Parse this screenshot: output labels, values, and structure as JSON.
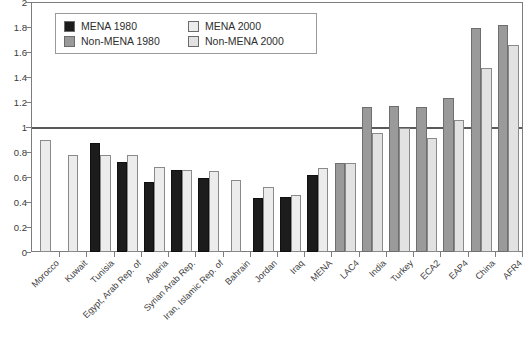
{
  "chart_data": {
    "type": "bar",
    "title": "",
    "xlabel": "",
    "ylabel": "",
    "ylim": [
      0,
      2
    ],
    "ytick_labels": [
      "2",
      "1.8",
      "1.6",
      "1.4",
      "1.2",
      "1",
      "0.8",
      "0.6",
      "0.4",
      "0.2",
      "0"
    ],
    "ytick_values": [
      2,
      1.8,
      1.6,
      1.4,
      1.2,
      1,
      0.8,
      0.6,
      0.4,
      0.2,
      0
    ],
    "grid": false,
    "reference_line": 1,
    "legend_position": "top-left",
    "categories": [
      "Morocco",
      "Kuwait",
      "Tunisia",
      "Egypt, Arab Rep. of",
      "Algeria",
      "Syrian Arab Rep.",
      "Iran, Islamic Rep. of",
      "Bahrain",
      "Jordan",
      "Iraq",
      "MENA",
      "LAC4",
      "India",
      "Turkey",
      "ECA2",
      "EAP4",
      "China",
      "AFR4"
    ],
    "series": [
      {
        "name": "MENA 1980",
        "color": "#1c1c1c",
        "values": [
          null,
          null,
          0.87,
          0.72,
          0.56,
          0.66,
          0.59,
          null,
          0.43,
          0.44,
          0.62,
          null,
          null,
          null,
          null,
          null,
          null,
          null
        ]
      },
      {
        "name": "MENA 2000",
        "color": "#ececec",
        "values": [
          0.9,
          0.78,
          0.78,
          0.78,
          0.68,
          0.66,
          0.65,
          0.58,
          0.52,
          0.46,
          0.67,
          null,
          null,
          null,
          null,
          null,
          null,
          null
        ]
      },
      {
        "name": "Non-MENA 1980",
        "color": "#9a9a9a",
        "values": [
          null,
          null,
          null,
          null,
          null,
          null,
          null,
          null,
          null,
          null,
          null,
          0.71,
          1.16,
          1.17,
          1.16,
          1.23,
          1.79,
          1.82
        ]
      },
      {
        "name": "Non-MENA 2000",
        "color": "#e2e2e2",
        "values": [
          null,
          null,
          null,
          null,
          null,
          null,
          null,
          null,
          null,
          null,
          null,
          0.71,
          0.95,
          0.99,
          0.91,
          1.06,
          1.47,
          1.66
        ]
      }
    ]
  },
  "legend": {
    "items": [
      {
        "label": "MENA 1980",
        "swatch": "#1c1c1c"
      },
      {
        "label": "MENA 2000",
        "swatch": "#ececec"
      },
      {
        "label": "Non-MENA 1980",
        "swatch": "#9a9a9a"
      },
      {
        "label": "Non-MENA 2000",
        "swatch": "#e2e2e2"
      }
    ]
  }
}
